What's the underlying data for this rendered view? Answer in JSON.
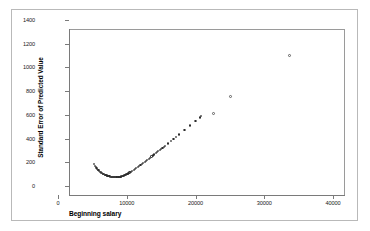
{
  "chart_data": {
    "type": "scatter",
    "title": "",
    "xlabel": "Beginning salary",
    "ylabel": "Standard Error of Predicted Value",
    "xlim": [
      0,
      40000
    ],
    "ylim": [
      0,
      1400
    ],
    "xticks": [
      0,
      10000,
      20000,
      30000,
      40000
    ],
    "yticks": [
      0,
      200,
      400,
      600,
      800,
      1000,
      1200,
      1400
    ],
    "xtick_labels": [
      "0",
      "10000",
      "20000",
      "30000",
      "40000"
    ],
    "ytick_labels": [
      "0",
      "200",
      "400",
      "600",
      "800",
      "1000",
      "1200",
      "1400"
    ],
    "grid": false,
    "legend": null,
    "marker": "open-circle",
    "marker_color": "#2c2c2c",
    "series": [
      {
        "name": "Standard Error of Predicted Value",
        "points": [
          [
            3600,
            262
          ],
          [
            3800,
            243
          ],
          [
            3900,
            234
          ],
          [
            4000,
            228
          ],
          [
            4100,
            221
          ],
          [
            4200,
            214
          ],
          [
            4300,
            208
          ],
          [
            4400,
            202
          ],
          [
            4500,
            197
          ],
          [
            4600,
            192
          ],
          [
            4700,
            188
          ],
          [
            4800,
            184
          ],
          [
            4900,
            180
          ],
          [
            5000,
            177
          ],
          [
            5100,
            174
          ],
          [
            5200,
            171
          ],
          [
            5300,
            168
          ],
          [
            5400,
            166
          ],
          [
            5500,
            164
          ],
          [
            5600,
            162
          ],
          [
            5700,
            160
          ],
          [
            5800,
            158
          ],
          [
            5900,
            157
          ],
          [
            6000,
            155
          ],
          [
            6100,
            154
          ],
          [
            6200,
            153
          ],
          [
            6300,
            152
          ],
          [
            6400,
            151
          ],
          [
            6500,
            150
          ],
          [
            6600,
            150
          ],
          [
            6700,
            149
          ],
          [
            6800,
            149
          ],
          [
            6900,
            149
          ],
          [
            7000,
            150
          ],
          [
            7100,
            150
          ],
          [
            7200,
            151
          ],
          [
            7300,
            152
          ],
          [
            7400,
            153
          ],
          [
            7500,
            155
          ],
          [
            7600,
            156
          ],
          [
            7700,
            158
          ],
          [
            7800,
            160
          ],
          [
            7900,
            162
          ],
          [
            8000,
            165
          ],
          [
            8100,
            167
          ],
          [
            8200,
            170
          ],
          [
            8300,
            173
          ],
          [
            8400,
            176
          ],
          [
            8500,
            179
          ],
          [
            8600,
            182
          ],
          [
            8700,
            186
          ],
          [
            8800,
            189
          ],
          [
            8900,
            193
          ],
          [
            9000,
            196
          ],
          [
            9200,
            204
          ],
          [
            9400,
            212
          ],
          [
            9600,
            220
          ],
          [
            9800,
            228
          ],
          [
            10000,
            236
          ],
          [
            10200,
            245
          ],
          [
            10400,
            253
          ],
          [
            10600,
            262
          ],
          [
            10800,
            270
          ],
          [
            11000,
            279
          ],
          [
            11200,
            288
          ],
          [
            11400,
            297
          ],
          [
            11600,
            306
          ],
          [
            11800,
            315
          ],
          [
            12000,
            324
          ],
          [
            12200,
            333
          ],
          [
            12400,
            342
          ],
          [
            12600,
            351
          ],
          [
            12800,
            360
          ],
          [
            13000,
            369
          ],
          [
            13200,
            378
          ],
          [
            13400,
            388
          ],
          [
            13600,
            397
          ],
          [
            13800,
            406
          ],
          [
            14000,
            416
          ],
          [
            14400,
            434
          ],
          [
            14800,
            453
          ],
          [
            15200,
            472
          ],
          [
            15600,
            491
          ],
          [
            16000,
            510
          ],
          [
            16800,
            548
          ],
          [
            17600,
            586
          ],
          [
            18400,
            625
          ],
          [
            19000,
            654
          ],
          [
            19200,
            664
          ]
        ]
      },
      {
        "name": "outliers",
        "points": [
          [
            21000,
            690
          ],
          [
            23400,
            830
          ],
          [
            32000,
            1180
          ]
        ]
      }
    ]
  }
}
